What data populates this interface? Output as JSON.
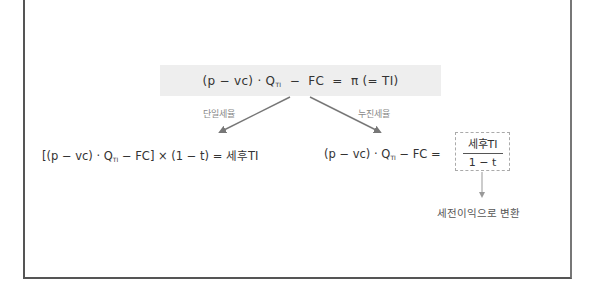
{
  "top_formula": {
    "prefix": "(p − vc) · Q",
    "subscript": "TI",
    "suffix": "  −  FC  =  π (= TI)"
  },
  "branches": {
    "left_label": "단일세율",
    "right_label": "누진세율"
  },
  "left_formula": {
    "prefix": "[(p − vc) · Q",
    "subscript": "TI",
    "suffix": " − FC] × (1 − t) = 세후TI"
  },
  "right_formula": {
    "prefix": "(p − vc) · Q",
    "subscript": "TI",
    "suffix": " − FC ="
  },
  "fraction": {
    "numerator": "세후TI",
    "denominator": "1 − t"
  },
  "note": "세전이익으로 변환",
  "colors": {
    "box_fill": "#eeeeee",
    "arrow": "#777777",
    "dashed_border": "#aaaaaa",
    "frame": "#555555"
  }
}
